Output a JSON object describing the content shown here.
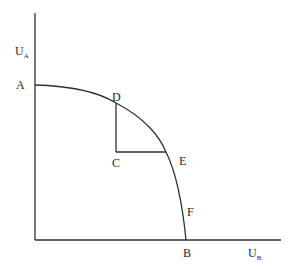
{
  "diagram": {
    "axes": {
      "y_label": "U",
      "y_label_sub": "A",
      "x_label": "U",
      "x_label_sub": "B"
    },
    "points": {
      "A": "A",
      "B": "B",
      "C": "C",
      "D": "D",
      "E": "E",
      "F": "F"
    },
    "colors": {
      "line": "#2f2f2f",
      "text": "#2a2a2a",
      "background": "#ffffff"
    }
  }
}
